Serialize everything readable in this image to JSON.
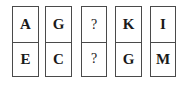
{
  "puzzle": {
    "cards": [
      {
        "top": "A",
        "bottom": "E"
      },
      {
        "top": "G",
        "bottom": "C"
      },
      {
        "top": "?",
        "bottom": "?"
      },
      {
        "top": "K",
        "bottom": "G"
      },
      {
        "top": "I",
        "bottom": "M"
      }
    ]
  }
}
